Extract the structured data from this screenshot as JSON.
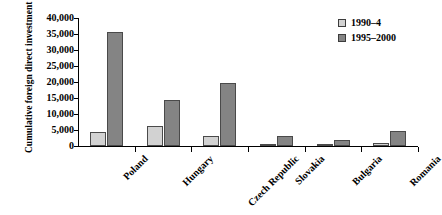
{
  "chart_data": {
    "type": "bar",
    "title": "",
    "xlabel": "",
    "ylabel": "Cumulative foreign direct investment (million $)",
    "ylim": [
      0,
      40000
    ],
    "ytick_labels": [
      "40,000",
      "35,000",
      "30,000",
      "25,000",
      "20,000",
      "15,000",
      "10,000",
      "5,000",
      "0"
    ],
    "ytick_values": [
      40000,
      35000,
      30000,
      25000,
      20000,
      15000,
      10000,
      5000,
      0
    ],
    "grid": false,
    "legend_position": "top-right",
    "categories": [
      "Poland",
      "Hungary",
      "Czech Republic",
      "Slovakia",
      "Bulgaria",
      "Romania"
    ],
    "series": [
      {
        "name": "1990–4",
        "color": "#d2d2d2",
        "values": [
          4300,
          6200,
          3000,
          600,
          400,
          900
        ]
      },
      {
        "name": "1995–2000",
        "color": "#848484",
        "values": [
          35700,
          14400,
          19800,
          3200,
          2000,
          4700
        ]
      }
    ]
  },
  "legend": {
    "items": [
      {
        "label": "1990–4",
        "swatch": "legend-swatch-1990-4"
      },
      {
        "label": "1995–2000",
        "swatch": "legend-swatch-1995-2000"
      }
    ]
  }
}
